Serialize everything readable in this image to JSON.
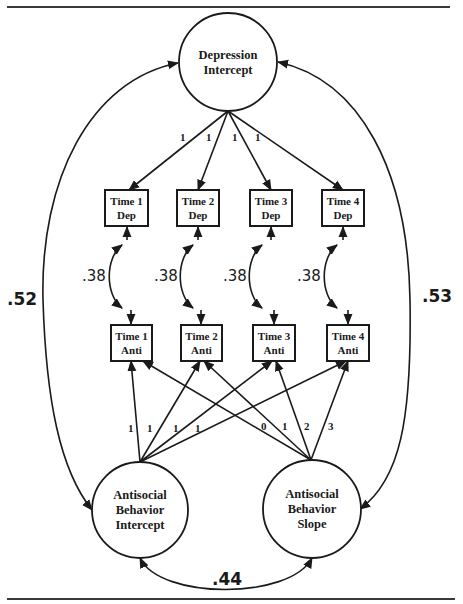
{
  "diagram": {
    "type": "structural-equation-model",
    "colors": {
      "ink": "#1a1a1a",
      "rule": "#3a3a3a",
      "background": "#ffffff"
    },
    "latent_factors": [
      {
        "id": "dep_int",
        "lines": [
          "Depression",
          "Intercept"
        ],
        "cx": 228,
        "cy": 62,
        "r": 49
      },
      {
        "id": "anti_int",
        "lines": [
          "Antisocial",
          "Behavior",
          "Intercept"
        ],
        "cx": 140,
        "cy": 510,
        "r": 48
      },
      {
        "id": "anti_slope",
        "lines": [
          "Antisocial",
          "Behavior",
          "Slope"
        ],
        "cx": 312,
        "cy": 509,
        "r": 49
      }
    ],
    "observed_dep": [
      {
        "id": "dep1",
        "lines": [
          "Time 1",
          "Dep"
        ],
        "x": 105,
        "y": 190,
        "w": 43,
        "h": 36
      },
      {
        "id": "dep2",
        "lines": [
          "Time 2",
          "Dep"
        ],
        "x": 177,
        "y": 190,
        "w": 42,
        "h": 36
      },
      {
        "id": "dep3",
        "lines": [
          "Time 3",
          "Dep"
        ],
        "x": 250,
        "y": 190,
        "w": 42,
        "h": 36
      },
      {
        "id": "dep4",
        "lines": [
          "Time 4",
          "Dep"
        ],
        "x": 322,
        "y": 190,
        "w": 42,
        "h": 36
      }
    ],
    "observed_anti": [
      {
        "id": "anti1",
        "lines": [
          "Time 1",
          "Anti"
        ],
        "x": 111,
        "y": 325,
        "w": 41,
        "h": 36
      },
      {
        "id": "anti2",
        "lines": [
          "Time 2",
          "Anti"
        ],
        "x": 181,
        "y": 325,
        "w": 41,
        "h": 36
      },
      {
        "id": "anti3",
        "lines": [
          "Time 3",
          "Anti"
        ],
        "x": 253,
        "y": 325,
        "w": 42,
        "h": 36
      },
      {
        "id": "anti4",
        "lines": [
          "Time 4",
          "Anti"
        ],
        "x": 327,
        "y": 325,
        "w": 42,
        "h": 36
      }
    ],
    "depression_loadings": [
      {
        "to": "dep1",
        "label": "1",
        "lx": 180,
        "ly": 141
      },
      {
        "to": "dep2",
        "label": "1",
        "lx": 206,
        "ly": 141
      },
      {
        "to": "dep3",
        "label": "1",
        "lx": 232,
        "ly": 141
      },
      {
        "to": "dep4",
        "label": "1",
        "lx": 255,
        "ly": 141
      }
    ],
    "intercept_loadings": [
      {
        "to": "anti1",
        "label": "1",
        "lx": 130,
        "ly": 432
      },
      {
        "to": "anti2",
        "label": "1",
        "lx": 149,
        "ly": 432
      },
      {
        "to": "anti3",
        "label": "1",
        "lx": 175,
        "ly": 432
      },
      {
        "to": "anti4",
        "label": "1",
        "lx": 197,
        "ly": 432
      }
    ],
    "slope_loadings": [
      {
        "to": "anti1",
        "label": "0",
        "lx": 264,
        "ly": 430
      },
      {
        "to": "anti2",
        "label": "1",
        "lx": 284,
        "ly": 430
      },
      {
        "to": "anti3",
        "label": "2",
        "lx": 306,
        "ly": 430
      },
      {
        "to": "anti4",
        "label": "3",
        "lx": 330,
        "ly": 430
      }
    ],
    "residual_correlations": [
      {
        "pair": [
          "dep1",
          "anti1"
        ],
        "label": ".38",
        "lx": 100,
        "ly": 281
      },
      {
        "pair": [
          "dep2",
          "anti2"
        ],
        "label": ".38",
        "lx": 172,
        "ly": 281
      },
      {
        "pair": [
          "dep3",
          "anti3"
        ],
        "label": ".38",
        "lx": 243,
        "ly": 281
      },
      {
        "pair": [
          "dep4",
          "anti4"
        ],
        "label": ".38",
        "lx": 317,
        "ly": 281
      }
    ],
    "factor_correlations": [
      {
        "pair": [
          "dep_int",
          "anti_int"
        ],
        "label": ".52",
        "lx": 24,
        "ly": 305
      },
      {
        "pair": [
          "dep_int",
          "anti_slope"
        ],
        "label": ".53",
        "lx": 438,
        "ly": 302
      },
      {
        "pair": [
          "anti_int",
          "anti_slope"
        ],
        "label": ".44",
        "lx": 227,
        "ly": 584
      }
    ]
  }
}
